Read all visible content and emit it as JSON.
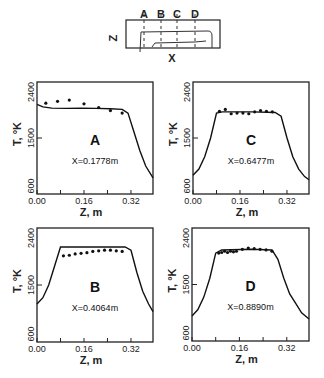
{
  "schematic": {
    "section_labels": [
      "A",
      "B",
      "C",
      "D"
    ],
    "z_axis_label": "Z",
    "x_axis_label": "X"
  },
  "chart_data": [
    {
      "type": "line",
      "panel": "A",
      "annotation": "X=0.1778m",
      "xlabel": "Z, m",
      "ylabel": "T, °K",
      "xticks": [
        "0.00",
        "0.16",
        "0.32"
      ],
      "yticks": [
        "600",
        "1500",
        "2400"
      ],
      "xlim": [
        0.0,
        0.395
      ],
      "ylim": [
        600,
        2400
      ],
      "series": [
        {
          "name": "computed",
          "style": "line",
          "x": [
            0.0,
            0.02,
            0.05,
            0.1,
            0.15,
            0.2,
            0.25,
            0.29,
            0.31,
            0.33,
            0.35,
            0.37,
            0.395
          ],
          "y": [
            2040,
            2000,
            1980,
            1975,
            1980,
            1975,
            1970,
            1960,
            1900,
            1600,
            1300,
            1050,
            860
          ]
        },
        {
          "name": "measured",
          "style": "points",
          "x": [
            0.03,
            0.07,
            0.11,
            0.16,
            0.21,
            0.25,
            0.29
          ],
          "y": [
            2060,
            2090,
            2110,
            2050,
            1990,
            1940,
            1900
          ]
        }
      ]
    },
    {
      "type": "line",
      "panel": "C",
      "annotation": "X=0.6477m",
      "xlabel": "Z, m",
      "ylabel": "T, °K",
      "xticks": [
        "0.00",
        "0.16",
        "0.32"
      ],
      "yticks": [
        "600",
        "1500",
        "2400"
      ],
      "xlim": [
        0.0,
        0.395
      ],
      "ylim": [
        600,
        2400
      ],
      "series": [
        {
          "name": "computed",
          "style": "line",
          "x": [
            0.0,
            0.02,
            0.04,
            0.06,
            0.08,
            0.1,
            0.2,
            0.28,
            0.3,
            0.32,
            0.34,
            0.36,
            0.38,
            0.395
          ],
          "y": [
            900,
            1000,
            1200,
            1500,
            1900,
            1920,
            1920,
            1910,
            1850,
            1500,
            1200,
            1000,
            880,
            830
          ]
        },
        {
          "name": "measured",
          "style": "points",
          "x": [
            0.09,
            0.11,
            0.13,
            0.15,
            0.17,
            0.19,
            0.21,
            0.23,
            0.25,
            0.27
          ],
          "y": [
            1930,
            1960,
            1890,
            1900,
            1900,
            1890,
            1920,
            1940,
            1930,
            1920
          ]
        }
      ]
    },
    {
      "type": "line",
      "panel": "B",
      "annotation": "X=0.4064m",
      "xlabel": "Z, m",
      "ylabel": "T, °K",
      "xticks": [
        "0.00",
        "0.16",
        "0.32"
      ],
      "yticks": [
        "600",
        "1500",
        "2400"
      ],
      "xlim": [
        0.0,
        0.395
      ],
      "ylim": [
        600,
        2400
      ],
      "series": [
        {
          "name": "computed",
          "style": "line",
          "x": [
            0.0,
            0.02,
            0.04,
            0.06,
            0.08,
            0.1,
            0.2,
            0.3,
            0.32,
            0.34,
            0.36,
            0.38,
            0.395
          ],
          "y": [
            1200,
            1300,
            1500,
            1800,
            2100,
            2100,
            2100,
            2100,
            2050,
            1700,
            1400,
            1200,
            1080
          ]
        },
        {
          "name": "measured",
          "style": "points",
          "x": [
            0.09,
            0.11,
            0.13,
            0.15,
            0.17,
            0.19,
            0.21,
            0.23,
            0.25,
            0.27,
            0.29
          ],
          "y": [
            1960,
            1970,
            1990,
            2000,
            2010,
            2030,
            2040,
            2050,
            2050,
            2040,
            2030
          ]
        }
      ]
    },
    {
      "type": "line",
      "panel": "D",
      "annotation": "X=0.8890m",
      "xlabel": "Z, m",
      "ylabel": "T, °K",
      "xticks": [
        "0.00",
        "0.16",
        "0.32"
      ],
      "yticks": [
        "600",
        "1500",
        "2400"
      ],
      "xlim": [
        0.0,
        0.395
      ],
      "ylim": [
        600,
        2400
      ],
      "series": [
        {
          "name": "computed",
          "style": "line",
          "x": [
            0.0,
            0.02,
            0.04,
            0.06,
            0.08,
            0.1,
            0.2,
            0.27,
            0.29,
            0.31,
            0.33,
            0.35,
            0.37,
            0.395
          ],
          "y": [
            1000,
            1100,
            1300,
            1600,
            2000,
            2050,
            2060,
            2050,
            1900,
            1600,
            1350,
            1200,
            1050,
            950
          ]
        },
        {
          "name": "measured",
          "style": "points",
          "x": [
            0.09,
            0.1,
            0.11,
            0.12,
            0.13,
            0.14,
            0.15,
            0.17,
            0.19,
            0.21,
            0.23,
            0.25,
            0.27
          ],
          "y": [
            2000,
            2010,
            2030,
            2010,
            2030,
            2020,
            2030,
            2060,
            2080,
            2070,
            2060,
            2050,
            2030
          ]
        }
      ]
    }
  ]
}
